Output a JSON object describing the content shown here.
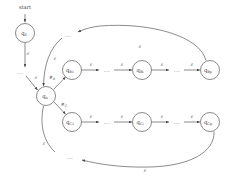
{
  "figure": {
    "type": "state-diagram",
    "start_label": "start",
    "ellipsis": "...",
    "epsilon": "ε"
  },
  "colors": {
    "node_stroke": "#6b6b6b",
    "node_fill": "#ffffff",
    "edge": "#5a5a5a",
    "text": "#3a3a3a",
    "background": "#ffffff"
  },
  "nodes": [
    {
      "id": "q0",
      "base": "q",
      "sub": "0",
      "cx": 25,
      "cy": 33,
      "r": 9.5
    },
    {
      "id": "qn",
      "base": "q",
      "sub": "n",
      "cx": 46,
      "cy": 96,
      "r": 9.5
    },
    {
      "id": "qB1",
      "base": "q",
      "sub": "B1",
      "cx": 72,
      "cy": 70,
      "r": 9.5
    },
    {
      "id": "qBi",
      "base": "q",
      "sub": "Bi",
      "cx": 142,
      "cy": 70,
      "r": 9.5
    },
    {
      "id": "qBp",
      "base": "q",
      "sub": "Bp",
      "cx": 210,
      "cy": 70,
      "r": 9.5
    },
    {
      "id": "qC1",
      "base": "q",
      "sub": "C1",
      "cx": 72,
      "cy": 122,
      "r": 9.5
    },
    {
      "id": "qCi",
      "base": "q",
      "sub": "Ci",
      "cx": 142,
      "cy": 122,
      "r": 9.5
    },
    {
      "id": "qCp",
      "base": "q",
      "sub": "Cp",
      "cx": 210,
      "cy": 122,
      "r": 9.5
    }
  ],
  "edge_labels": [
    {
      "id": "start-to-q0",
      "text": "",
      "sub": "",
      "x": 25,
      "y": 16
    },
    {
      "id": "q0-to-qn",
      "text": "ε",
      "sub": "",
      "x": 28,
      "y": 55
    },
    {
      "id": "dots-to-qn",
      "text": "ε",
      "sub": "",
      "x": 36,
      "y": 79
    },
    {
      "id": "qn-to-qB1",
      "text": "#",
      "sub": "B",
      "x": 52,
      "y": 79
    },
    {
      "id": "qn-to-qC1",
      "text": "#",
      "sub": "C",
      "x": 64,
      "y": 106
    },
    {
      "id": "qB1-to-next",
      "text": "ε",
      "sub": "",
      "x": 91,
      "y": 66
    },
    {
      "id": "qBdots-to-qBi",
      "text": "ε",
      "sub": "",
      "x": 122,
      "y": 66
    },
    {
      "id": "qBi-to-dots",
      "text": "ε",
      "sub": "",
      "x": 162,
      "y": 66
    },
    {
      "id": "qBdots-to-qBp",
      "text": "ε",
      "sub": "",
      "x": 192,
      "y": 66
    },
    {
      "id": "qC1-to-next",
      "text": "ε",
      "sub": "",
      "x": 91,
      "y": 118
    },
    {
      "id": "qCdots-to-qCi",
      "text": "ε",
      "sub": "",
      "x": 122,
      "y": 118
    },
    {
      "id": "qCi-to-dots",
      "text": "ε",
      "sub": "",
      "x": 162,
      "y": 118
    },
    {
      "id": "qCdots-to-qCp",
      "text": "ε",
      "sub": "",
      "x": 192,
      "y": 118
    },
    {
      "id": "top-return",
      "text": "ε",
      "sub": "",
      "x": 140,
      "y": 48
    },
    {
      "id": "top-entry",
      "text": "ε",
      "sub": "",
      "x": 55,
      "y": 60
    },
    {
      "id": "bottom-entry",
      "text": "ε",
      "sub": "",
      "x": 44,
      "y": 145
    },
    {
      "id": "bottom-return",
      "text": "ε",
      "sub": "",
      "x": 145,
      "y": 172
    }
  ],
  "ellipses_marks": [
    {
      "id": "dots-left-upper",
      "x": 20,
      "y": 72
    },
    {
      "id": "dots-top-loop",
      "x": 68,
      "y": 35
    },
    {
      "id": "dots-B-mid-left",
      "x": 107,
      "y": 70
    },
    {
      "id": "dots-B-mid-right",
      "x": 177,
      "y": 70
    },
    {
      "id": "dots-C-mid-left",
      "x": 107,
      "y": 122
    },
    {
      "id": "dots-C-mid-right",
      "x": 177,
      "y": 122
    },
    {
      "id": "dots-bottom-loop",
      "x": 70,
      "y": 157
    }
  ]
}
